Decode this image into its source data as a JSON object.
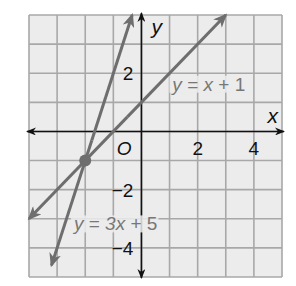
{
  "chart_data": {
    "type": "line",
    "title": "",
    "xlabel": "x",
    "ylabel": "y",
    "xlim": [
      -4,
      5
    ],
    "ylim": [
      -5,
      4
    ],
    "grid": true,
    "x_ticks": [
      {
        "value": 2,
        "label": "2"
      },
      {
        "value": 4,
        "label": "4"
      }
    ],
    "y_ticks": [
      {
        "value": 2,
        "label": "2"
      },
      {
        "value": -2,
        "label": "−2"
      },
      {
        "value": -4,
        "label": "−4"
      }
    ],
    "origin_label": "O",
    "series": [
      {
        "name": "y = x + 1",
        "slope": 1,
        "intercept": 1,
        "x": [
          -4,
          3
        ],
        "y": [
          -3,
          4
        ],
        "arrows": "both",
        "label_position": {
          "x": 1.1,
          "y": 1.4
        }
      },
      {
        "name": "y = 3x + 5",
        "slope": 3,
        "intercept": 5,
        "x": [
          -3.2,
          -0.33
        ],
        "y": [
          -4.6,
          4
        ],
        "arrows": "both",
        "label_position": {
          "x": -2.4,
          "y": -3.4
        }
      }
    ],
    "points": [
      {
        "x": -2,
        "y": -1,
        "label": "intersection"
      }
    ],
    "colors": {
      "grid_background": "#ececec",
      "grid_lines": "#a8a8a8",
      "axes": "#111111",
      "lines": "#6e6e6e",
      "equation_labels": "#777777"
    }
  }
}
